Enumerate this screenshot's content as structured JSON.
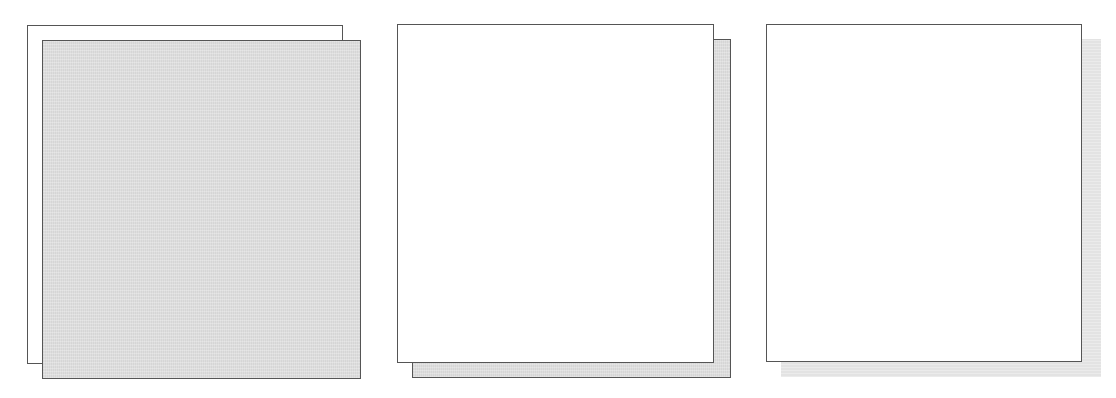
{
  "figure": {
    "description": "Three panels illustrating layered rectangles / drop-shadow styles",
    "colors": {
      "outline": "#555555",
      "paper": "#ffffff",
      "fill_gray": "#dedede",
      "shadow_gray": "#e3e3e3"
    },
    "panels": [
      {
        "id": "panel-1",
        "style": "offset outlined copy, gray front layer",
        "back": {
          "x": 27,
          "y": 25,
          "w": 315,
          "h": 338,
          "fill": "white",
          "border": true
        },
        "front": {
          "x": 42,
          "y": 40,
          "w": 318,
          "h": 338,
          "fill": "gray",
          "border": true
        }
      },
      {
        "id": "panel-2",
        "style": "outlined drop shadow",
        "back": {
          "x": 412,
          "y": 39,
          "w": 318,
          "h": 338,
          "fill": "gray",
          "border": true
        },
        "front": {
          "x": 397,
          "y": 24,
          "w": 316,
          "h": 338,
          "fill": "white",
          "border": true
        }
      },
      {
        "id": "panel-3",
        "style": "soft borderless drop shadow",
        "back": {
          "x": 781,
          "y": 39,
          "w": 319,
          "h": 337,
          "fill": "gray",
          "border": false
        },
        "front": {
          "x": 766,
          "y": 24,
          "w": 315,
          "h": 337,
          "fill": "white",
          "border": true
        }
      }
    ]
  }
}
